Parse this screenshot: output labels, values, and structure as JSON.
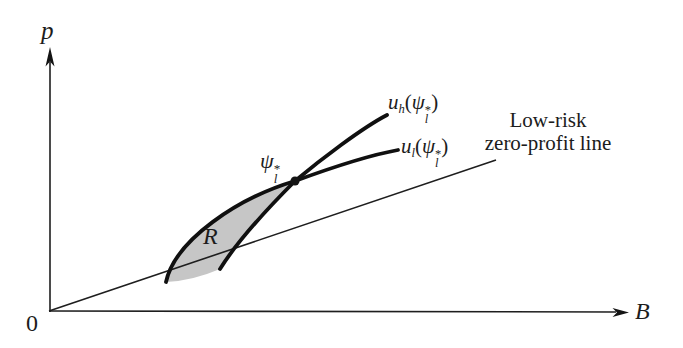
{
  "figure": {
    "colors": {
      "background": "#ffffff",
      "ink": "#1e1e1e",
      "curve_ink": "#101010",
      "shade": "#c6c6c6"
    },
    "axes": {
      "y_label": "p",
      "x_label": "B",
      "origin_label": "0"
    },
    "labels": {
      "uh_curve": {
        "u": "u",
        "u_sub": "h",
        "open": "(",
        "psi": "ψ",
        "psi_sup": "*",
        "psi_sub": "l",
        "close": ")"
      },
      "ul_curve": {
        "u": "u",
        "u_sub": "l",
        "open": "(",
        "psi": "ψ",
        "psi_sup": "*",
        "psi_sub": "l",
        "close": ")"
      },
      "tangency_point": {
        "psi": "ψ",
        "psi_sup": "*",
        "psi_sub": "l"
      },
      "shaded_region": "R",
      "zero_profit_line": [
        "Low-risk",
        "zero-profit line"
      ]
    },
    "geometry": {
      "lens_region": "M 166 282 C 175 240 238 198 295 181 C 272 204 238 240 220 269 Q 192 281 166 282 Z",
      "zero_profit_line": "M 49 311 L 496 160",
      "y_axis": "M 50 312 L 50 62",
      "y_axis_arrow": "50,47 45.5,66.5 50,61.5 54.5,66.5",
      "x_axis": "M 49 311 L 616 312",
      "x_axis_arrow": "629,312.5 612.5,308 617,312.5 612.5,317",
      "ul_curve": "M 166 282 C 175 240 238 198 295 181 C 325 170 370 155 398 150",
      "uh_curve": "M 220 269 C 238 240 272 204 295 181 C 320 160 362 128 387 115",
      "point_dot": "M 290.5 181 A 4.5 4.5 0 1 0 299.5 181 A 4.5 4.5 0 1 0 290.5 181 Z"
    }
  }
}
